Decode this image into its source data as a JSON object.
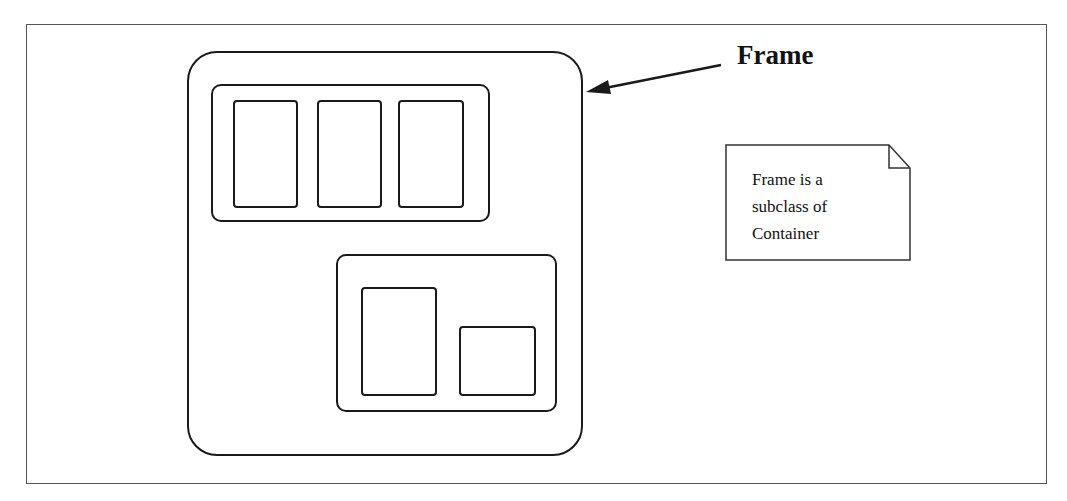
{
  "diagram": {
    "label": "Frame",
    "note": {
      "lines": [
        "Frame is a",
        "subclass of",
        "Container"
      ]
    },
    "elements": {
      "frame": "rounded container (Frame)",
      "panel_top": {
        "children": 3
      },
      "panel_bottom": {
        "children": 2
      }
    },
    "colors": {
      "stroke": "#1a1a1a",
      "border": "#555555",
      "background": "#ffffff"
    }
  }
}
